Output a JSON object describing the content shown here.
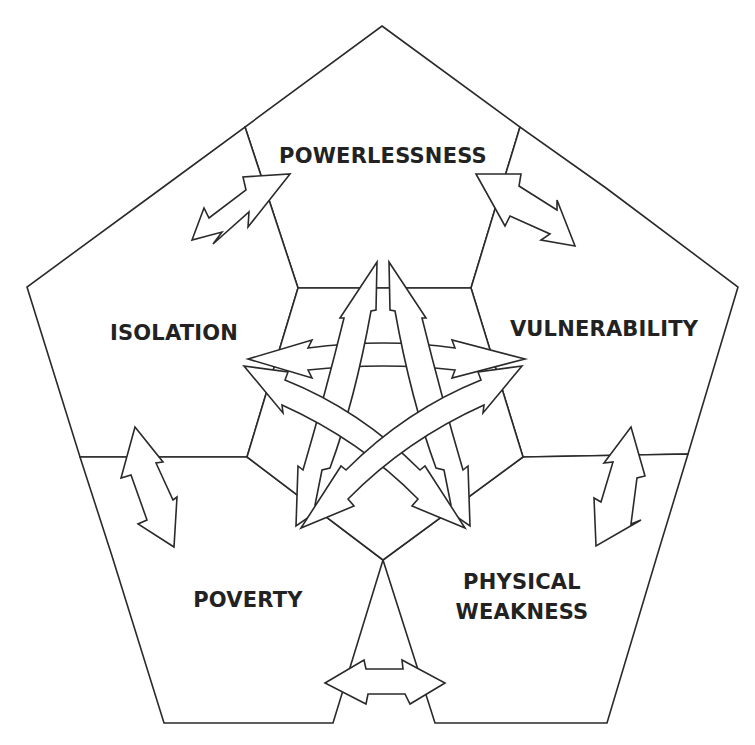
{
  "diagram": {
    "type": "deprivation-trap",
    "nodes": [
      {
        "id": "powerlessness",
        "label": "POWERLESSNESS"
      },
      {
        "id": "isolation",
        "label": "ISOLATION"
      },
      {
        "id": "vulnerability",
        "label": "VULNERABILITY"
      },
      {
        "id": "poverty",
        "label": "POVERTY"
      },
      {
        "id": "physical_weakness",
        "label_line1": "PHYSICAL",
        "label_line2": "WEAKNESS"
      }
    ],
    "edges": [
      {
        "from": "powerlessness",
        "to": "isolation",
        "direction": "both"
      },
      {
        "from": "powerlessness",
        "to": "vulnerability",
        "direction": "both"
      },
      {
        "from": "isolation",
        "to": "poverty",
        "direction": "both"
      },
      {
        "from": "vulnerability",
        "to": "physical_weakness",
        "direction": "both"
      },
      {
        "from": "poverty",
        "to": "physical_weakness",
        "direction": "both"
      },
      {
        "from": "isolation",
        "to": "vulnerability",
        "direction": "both"
      },
      {
        "from": "powerlessness",
        "to": "poverty",
        "direction": "both"
      },
      {
        "from": "powerlessness",
        "to": "physical_weakness",
        "direction": "both"
      },
      {
        "from": "isolation",
        "to": "physical_weakness",
        "direction": "both"
      },
      {
        "from": "vulnerability",
        "to": "poverty",
        "direction": "both"
      }
    ],
    "colors": {
      "stroke": "#2a2a2a",
      "fill": "#ffffff",
      "text": "#222222"
    }
  }
}
